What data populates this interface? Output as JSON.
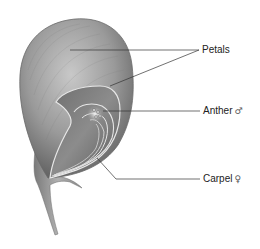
{
  "diagram": {
    "labels": [
      {
        "id": "petals",
        "text": "Petals",
        "symbol": ""
      },
      {
        "id": "anther",
        "text": "Anther",
        "symbol": "♂"
      },
      {
        "id": "carpel",
        "text": "Carpel",
        "symbol": "♀"
      }
    ],
    "colors": {
      "petal_outer": "#8a8a8a",
      "petal_light": "#c4c4c4",
      "petal_dark": "#555555",
      "inner_outline": "#e4e4e4",
      "leader_line": "#333333",
      "label_text": "#222222"
    }
  }
}
